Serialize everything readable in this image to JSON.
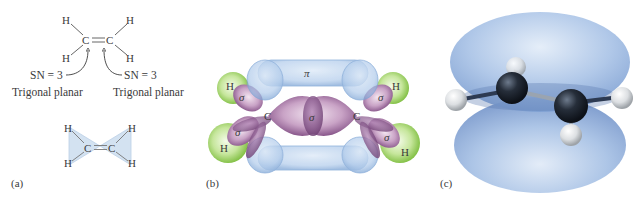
{
  "figure": {
    "panel_a": {
      "label": "(a)",
      "lewis": {
        "atoms": {
          "h_top_left": "H",
          "h_top_right": "H",
          "c_left": "C",
          "c_right": "C",
          "h_bottom_left": "H",
          "h_bottom_right": "H"
        },
        "sn_left": "SN = 3",
        "sn_right": "SN = 3",
        "geometry_left": "Trigonal planar",
        "geometry_right": "Trigonal planar"
      },
      "planar": {
        "atoms": {
          "h_top_left": "H",
          "h_top_right": "H",
          "c_left": "C",
          "c_right": "C",
          "h_bottom_left": "H",
          "h_bottom_right": "H"
        }
      }
    },
    "panel_b": {
      "label": "(b)",
      "pi_label": "π",
      "sigma_center": "σ",
      "sigma_ul": "σ",
      "sigma_ll": "σ",
      "sigma_ur": "σ",
      "sigma_lr": "σ",
      "c_left": "C",
      "c_right": "C",
      "h_ul": "H",
      "h_ll": "H",
      "h_ur": "H",
      "h_lr": "H"
    },
    "panel_c": {
      "label": "(c)"
    },
    "colors": {
      "pi_orbital": "#9fc0e6",
      "sigma_orbital": "#8a5a8e",
      "hydrogen_orbital": "#9acd5a",
      "plane_fill": "#cfdff0",
      "carbon_atom": "#1e2530",
      "hydrogen_atom": "#e6e8ea"
    }
  }
}
